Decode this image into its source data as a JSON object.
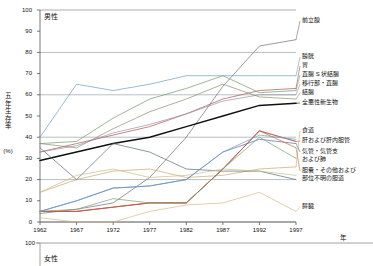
{
  "figure": {
    "panels": [
      {
        "name": "male-panel",
        "title": "男性"
      },
      {
        "name": "female-panel",
        "title": "女性"
      }
    ],
    "y_axis_title": "五年生存率",
    "y_axis_unit": "(%)",
    "x_axis_title": "年"
  },
  "chart_data": {
    "type": "line",
    "title": "男性",
    "subtitle": "女性",
    "xlabel": "年",
    "ylabel": "五年生存率",
    "yunit": "(%)",
    "ylim": [
      0,
      100
    ],
    "yticks": [
      0,
      10,
      20,
      30,
      40,
      50,
      60,
      70,
      80,
      90,
      100
    ],
    "grid": "horizontal-major",
    "legend_position": "right",
    "x": [
      1962,
      1967,
      1972,
      1977,
      1982,
      1987,
      1992,
      1997
    ],
    "xticks": [
      "1962",
      "1967",
      "1972",
      "1977",
      "1982",
      "1987",
      "1992",
      "1997"
    ],
    "series": [
      {
        "name": "前立腺",
        "color": "#6f6f6f",
        "values": [
          4,
          6,
          9,
          21,
          40,
          64,
          83,
          86
        ]
      },
      {
        "name": "膀胱",
        "color": "#6d9dc2",
        "values": [
          40,
          65,
          62,
          65,
          69,
          69,
          69,
          69
        ]
      },
      {
        "name": "胃",
        "color": "#a9534d",
        "values": [
          33,
          37,
          41,
          45,
          51,
          58,
          62,
          63
        ]
      },
      {
        "name": "直腸 S 状結腸",
        "color": "#6f9a6a",
        "values": [
          37,
          38,
          49,
          58,
          63,
          69,
          61,
          62
        ]
      },
      {
        "name": "移行部・直腸",
        "color": "#9b8fa3",
        "values": [
          33,
          36,
          42,
          46,
          51,
          57,
          60,
          60
        ]
      },
      {
        "name": "結腸",
        "color": "#8a8f6d",
        "values": [
          37,
          35,
          44,
          52,
          58,
          65,
          59,
          58
        ]
      },
      {
        "name": "全悪性新生物",
        "color": "#111111",
        "values": [
          29,
          33,
          37,
          40,
          45,
          50,
          55,
          56
        ]
      },
      {
        "name": "食道",
        "color": "#c9a96a",
        "values": [
          14,
          20,
          24,
          25,
          21,
          22,
          25,
          26
        ]
      },
      {
        "name": "肝および肝内胆管",
        "color": "#b5794f",
        "values": [
          5,
          5,
          7,
          9,
          9,
          25,
          43,
          38
        ]
      },
      {
        "name": "気管・気管支および肺",
        "color": "#4f6fa8",
        "values": [
          5,
          10,
          16,
          17,
          20,
          33,
          39,
          37
        ]
      },
      {
        "name": "胆嚢・その他および部位不明の胆道",
        "color": "#cc6633",
        "values": [
          5,
          5,
          7,
          9,
          9,
          25,
          43,
          35
        ]
      },
      {
        "name": "膵臓",
        "color": "#d9b88a",
        "values": [
          2,
          0,
          0,
          5,
          8,
          9,
          14,
          5
        ]
      },
      {
        "name": "unlabeled-upper",
        "color": "#5a6a7a",
        "values": [
          35,
          20,
          37,
          33,
          25,
          24,
          24,
          20
        ]
      },
      {
        "name": "unlabeled-lower",
        "color": "#c6bb8f",
        "values": [
          14,
          22,
          25,
          21,
          22,
          25,
          24,
          22
        ]
      },
      {
        "name": "unlabeled-red",
        "color": "#c4484a",
        "values": [
          5,
          5,
          7,
          9,
          9,
          25,
          43,
          38
        ]
      },
      {
        "name": "unlabeled-green",
        "color": "#7aa06f",
        "values": [
          5,
          6,
          11,
          9,
          9,
          25,
          40,
          30
        ]
      },
      {
        "name": "unlabeled-steel",
        "color": "#6d9dc2",
        "values": [
          5,
          10,
          16,
          17,
          20,
          33,
          41,
          39
        ]
      }
    ]
  },
  "legend": {
    "items": [
      {
        "label": "前立腺",
        "name": "legend-prostate"
      },
      {
        "label": "膀胱",
        "name": "legend-bladder"
      },
      {
        "label": "胃",
        "name": "legend-stomach"
      },
      {
        "label": "直腸 S 状結腸",
        "name": "legend-rectosigmoid"
      },
      {
        "label": "移行部・直腸",
        "name": "legend-rectum"
      },
      {
        "label": "結腸",
        "name": "legend-colon"
      },
      {
        "label": "全悪性新生物",
        "name": "legend-all-malignant"
      },
      {
        "label": "食道",
        "name": "legend-esophagus"
      },
      {
        "label": "肝および肝内胆管",
        "name": "legend-liver"
      },
      {
        "label": "気管・気管支",
        "name": "legend-trachea-1"
      },
      {
        "label": "および肺",
        "name": "legend-trachea-2"
      },
      {
        "label": "胆嚢・その他および",
        "name": "legend-gallbladder-1"
      },
      {
        "label": "部位不明の胆道",
        "name": "legend-gallbladder-2"
      },
      {
        "label": "膵臓",
        "name": "legend-pancreas"
      }
    ]
  }
}
